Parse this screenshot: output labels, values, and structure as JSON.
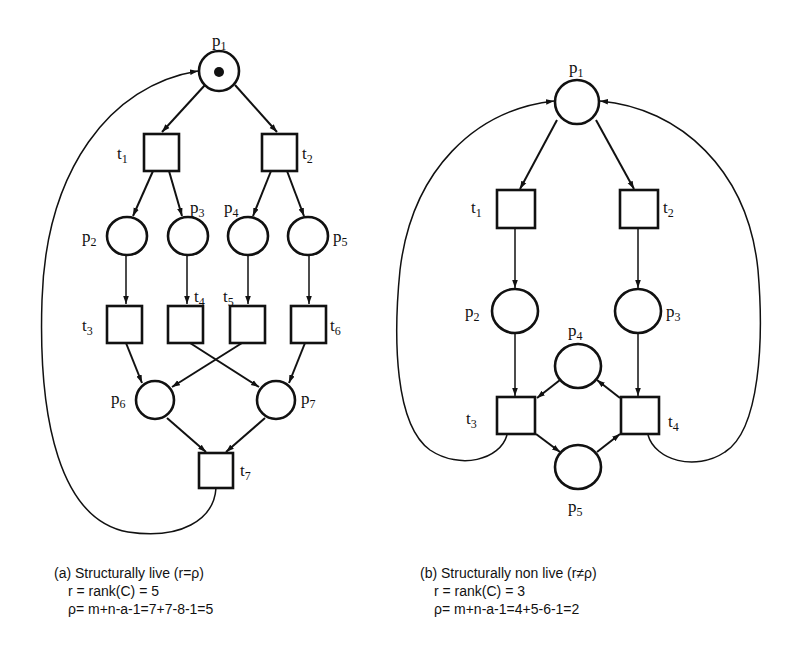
{
  "figure": {
    "net_a": {
      "places": [
        {
          "id": "p1",
          "label": "p",
          "sub": "1",
          "token": true
        },
        {
          "id": "p2",
          "label": "p",
          "sub": "2"
        },
        {
          "id": "p3",
          "label": "p",
          "sub": "3"
        },
        {
          "id": "p4",
          "label": "p",
          "sub": "4"
        },
        {
          "id": "p5",
          "label": "p",
          "sub": "5"
        },
        {
          "id": "p6",
          "label": "p",
          "sub": "6"
        },
        {
          "id": "p7",
          "label": "p",
          "sub": "7"
        }
      ],
      "transitions": [
        {
          "id": "t1",
          "label": "t",
          "sub": "1"
        },
        {
          "id": "t2",
          "label": "t",
          "sub": "2"
        },
        {
          "id": "t3",
          "label": "t",
          "sub": "3"
        },
        {
          "id": "t4",
          "label": "t",
          "sub": "4"
        },
        {
          "id": "t5",
          "label": "t",
          "sub": "5"
        },
        {
          "id": "t6",
          "label": "t",
          "sub": "6"
        },
        {
          "id": "t7",
          "label": "t",
          "sub": "7"
        }
      ],
      "arcs": [
        [
          "p1",
          "t1"
        ],
        [
          "p1",
          "t2"
        ],
        [
          "t1",
          "p2"
        ],
        [
          "t1",
          "p3"
        ],
        [
          "t2",
          "p4"
        ],
        [
          "t2",
          "p5"
        ],
        [
          "p2",
          "t3"
        ],
        [
          "p3",
          "t4"
        ],
        [
          "p4",
          "t5"
        ],
        [
          "p5",
          "t6"
        ],
        [
          "t3",
          "p6"
        ],
        [
          "t5",
          "p6"
        ],
        [
          "t4",
          "p7"
        ],
        [
          "t6",
          "p7"
        ],
        [
          "p6",
          "t7"
        ],
        [
          "p7",
          "t7"
        ],
        [
          "t7",
          "p1"
        ]
      ],
      "caption": {
        "title": "(a) Structurally live (r=ρ)",
        "line1": "r = rank(C) = 5",
        "line2": "ρ= m+n-a-1=7+7-8-1=5"
      }
    },
    "net_b": {
      "places": [
        {
          "id": "p1",
          "label": "p",
          "sub": "1"
        },
        {
          "id": "p2",
          "label": "p",
          "sub": "2"
        },
        {
          "id": "p3",
          "label": "p",
          "sub": "3"
        },
        {
          "id": "p4",
          "label": "p",
          "sub": "4"
        },
        {
          "id": "p5",
          "label": "p",
          "sub": "5"
        }
      ],
      "transitions": [
        {
          "id": "t1",
          "label": "t",
          "sub": "1"
        },
        {
          "id": "t2",
          "label": "t",
          "sub": "2"
        },
        {
          "id": "t3",
          "label": "t",
          "sub": "3"
        },
        {
          "id": "t4",
          "label": "t",
          "sub": "4"
        }
      ],
      "arcs": [
        [
          "p1",
          "t1"
        ],
        [
          "p1",
          "t2"
        ],
        [
          "t1",
          "p2"
        ],
        [
          "t2",
          "p3"
        ],
        [
          "p2",
          "t3"
        ],
        [
          "p3",
          "t4"
        ],
        [
          "p4",
          "t3"
        ],
        [
          "t4",
          "p4"
        ],
        [
          "t3",
          "p5"
        ],
        [
          "p5",
          "t4"
        ],
        [
          "t3",
          "p1"
        ],
        [
          "t4",
          "p1"
        ]
      ],
      "caption": {
        "title": "(b) Structurally non live (r≠ρ)",
        "line1": "r = rank(C) = 3",
        "line2": "ρ= m+n-a-1=4+5-6-1=2"
      }
    }
  }
}
